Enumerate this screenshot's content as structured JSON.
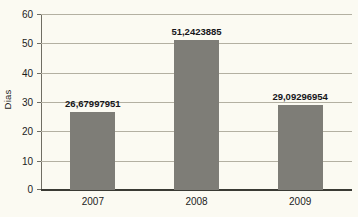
{
  "chart_data": {
    "type": "bar",
    "title": "",
    "xlabel": "",
    "ylabel": "Dias",
    "categories": [
      "2007",
      "2008",
      "2009"
    ],
    "values": [
      26.67997951,
      51.2423885,
      29.09296954
    ],
    "value_labels": [
      "26,67997951",
      "51,2423885",
      "29,09296954"
    ],
    "ylim": [
      0,
      60
    ],
    "ytick_labels": [
      "0",
      "10",
      "20",
      "30",
      "40",
      "50",
      "60"
    ],
    "ytick_values": [
      0,
      10,
      20,
      30,
      40,
      50,
      60
    ],
    "grid": true,
    "legend": "none",
    "bar_color": "#7e7d77",
    "background_color": "#fbfaf2",
    "gridline_color": "#b3b0a2",
    "axis_color": "#3a3a34",
    "text_color": "#1c1c1c"
  }
}
